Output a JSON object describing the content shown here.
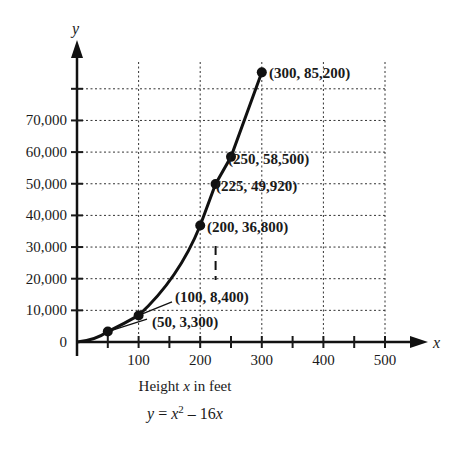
{
  "chart_data": {
    "type": "line",
    "title": "",
    "xlabel": "Height x in feet",
    "ylabel": "y",
    "x_axis_var": "x",
    "y_axis_var": "y",
    "equation": "y = x^2 - 16x",
    "xlim": [
      0,
      500
    ],
    "ylim": [
      0,
      80000
    ],
    "grid": true,
    "x_ticks": [
      100,
      200,
      300,
      400,
      500
    ],
    "x_tick_labels": [
      "100",
      "200",
      "300",
      "400",
      "500"
    ],
    "y_ticks": [
      0,
      10000,
      20000,
      30000,
      40000,
      50000,
      60000,
      70000,
      80000
    ],
    "y_tick_labels": [
      "0",
      "10,000",
      "20,000",
      "30,000",
      "40,000",
      "50,000",
      "60,000",
      "70,000",
      ""
    ],
    "series": [
      {
        "name": "y = x^2 - 16x",
        "x": [
          50,
          100,
          200,
          225,
          250,
          300
        ],
        "y": [
          3300,
          8400,
          36800,
          49920,
          58500,
          85200
        ]
      }
    ],
    "points": [
      {
        "x": 50,
        "y": 3300,
        "label": "(50, 3,300)"
      },
      {
        "x": 100,
        "y": 8400,
        "label": "(100, 8,400)"
      },
      {
        "x": 200,
        "y": 36800,
        "label": "(200, 36,800)"
      },
      {
        "x": 225,
        "y": 49920,
        "label": "(225, 49,920)"
      },
      {
        "x": 250,
        "y": 58500,
        "label": "(250, 58,500)"
      },
      {
        "x": 300,
        "y": 85200,
        "label": "(300, 85,200)"
      }
    ],
    "annotations": [
      "dashed vertical marker at x = 225"
    ]
  },
  "caption": {
    "xlabel_prefix": "Height ",
    "xlabel_var": "x",
    "xlabel_suffix": " in feet",
    "eq_y": "y",
    "eq_eq": " = ",
    "eq_x": "x",
    "eq_exp": "2",
    "eq_minus": " – 16",
    "eq_x2": "x"
  }
}
